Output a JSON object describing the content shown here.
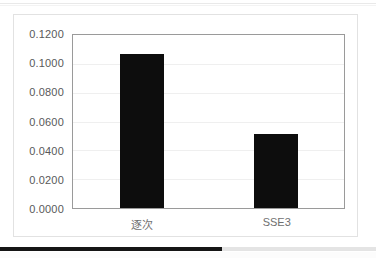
{
  "chart_data": {
    "type": "bar",
    "title": "",
    "xlabel": "",
    "ylabel": "",
    "categories": [
      "逐次",
      "SSE3"
    ],
    "values": [
      0.1065,
      0.051
    ],
    "ylim": [
      0.0,
      0.12
    ],
    "ytick_step": 0.02,
    "ytick_labels": [
      "0.1200",
      "0.1000",
      "0.0800",
      "0.0600",
      "0.0400",
      "0.0200",
      "0.0000"
    ],
    "ytick_values": [
      0.12,
      0.1,
      0.08,
      0.06,
      0.04,
      0.02,
      0.0
    ],
    "grid": true,
    "legend": "none",
    "series": [
      {
        "name": "series-1",
        "color": "#0d0d0d",
        "values": [
          0.1065,
          0.051
        ]
      }
    ],
    "bar_color": "#0d0d0d",
    "plot_border_color": "#9a9a9a",
    "gridline_color": "#efefef",
    "axis_text_color": "#595959",
    "category_text_color": "#6f6f6f",
    "card_background": "#ffffff",
    "card_border_color": "#e2e2e2"
  },
  "bottom_bar": {
    "fill_percent": 59,
    "fill_color": "#151515",
    "track_color": "#e4e4e4"
  }
}
